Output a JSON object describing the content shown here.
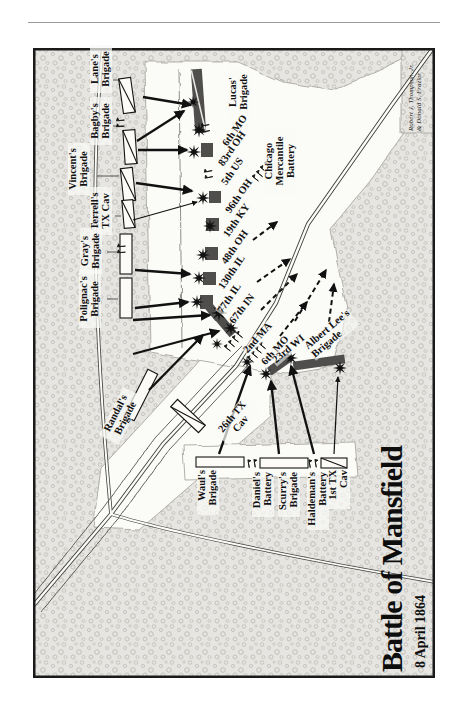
{
  "title": "Battle of Mansfield",
  "date": "8 April 1864",
  "credit": {
    "line1": "Robert J. Thompson, Jr.",
    "line2": "& Donald S. Frazier"
  },
  "confederate": {
    "lane": "Lane's\nBrigade",
    "bagby": "Bagby's\nBrigade",
    "vincent": "Vincent's\nBrigade",
    "terrell": "Terrell's\nTX Cav",
    "gray": "Gray's\nBrigade",
    "polignac": "Polignac's\nBrigade",
    "randal": "Randal's\nBrigade",
    "cav26tx": "26th TX\nCav",
    "waul": "Waul's\nBrigade",
    "daniel": "Daniel's\nBattery",
    "scurry": "Scurry's\nBrigade",
    "haldeman": "Haldeman's\nBattery",
    "cav1tx": "1st TX\nCav"
  },
  "union": {
    "lucas": "Lucas'\nBrigade",
    "mo6North": "6th MO",
    "oh83": "83rd OH",
    "us5": "5th US",
    "oh96": "96th OH",
    "ky19": "19th KY",
    "oh48": "48th OH",
    "il130": "130th IL",
    "il77": "77th IL",
    "in67": "67th IN",
    "ma2": "2nd MA",
    "mo6South": "6th MO",
    "wi23": "23rd WI",
    "albertLee": "Albert Lee's\nBrigade",
    "chicago": "Chicago\nMercantile\nBattery"
  }
}
